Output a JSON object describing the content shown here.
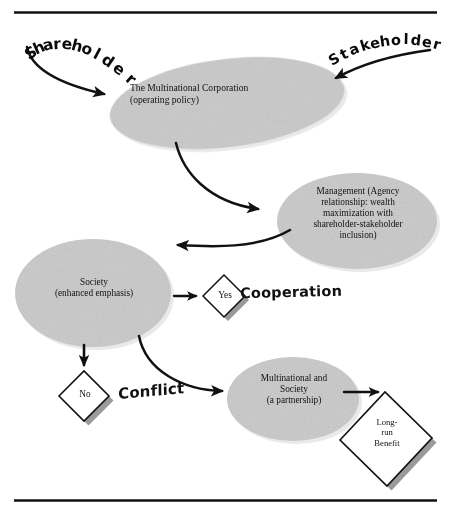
{
  "figure": {
    "top_rule": true,
    "bottom_rule": true,
    "background_color": "#ffffff",
    "ellipse_fill": "#c9c9c9",
    "diamond_fill": "#ffffff",
    "shadow_color": "#9a9a9a",
    "stroke_color": "#111111"
  },
  "inputs": {
    "shareholder": "Shareholder",
    "stakeholder": "Stakeholder"
  },
  "nodes": {
    "corporation": {
      "label": "The Multinational Corporation\n(operating policy)",
      "shape": "ellipse"
    },
    "management": {
      "label": "Management (Agency\nrelationship: wealth\nmaximization with\nshareholder-stakeholder\ninclusion)",
      "shape": "ellipse"
    },
    "society": {
      "label": "Society\n(enhanced emphasis)",
      "shape": "ellipse"
    },
    "partnership": {
      "label": "Multinational and\nSociety\n(a partnership)",
      "shape": "ellipse"
    },
    "yes_decision": {
      "label": "Yes",
      "shape": "diamond"
    },
    "no_decision": {
      "label": "No",
      "shape": "diamond"
    },
    "long_run_benefit": {
      "label": "Long-\nrun\nBenefit",
      "shape": "diamond"
    }
  },
  "outcomes": {
    "cooperation": "Cooperation",
    "conflict": "Conflict"
  }
}
